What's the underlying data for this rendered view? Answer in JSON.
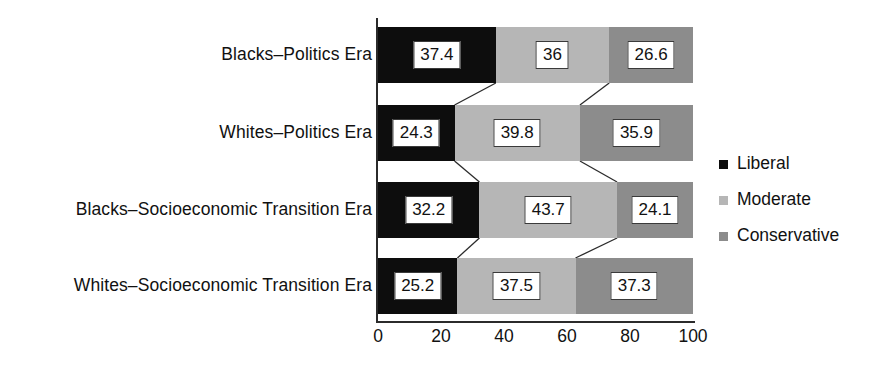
{
  "chart_data": {
    "type": "bar",
    "orientation": "horizontal",
    "stacked": true,
    "title": "",
    "subtitle": "",
    "xlabel": "",
    "ylabel": "",
    "xlim": [
      0,
      100
    ],
    "xticks": [
      "0",
      "20",
      "40",
      "60",
      "80",
      "100"
    ],
    "xtick_values": [
      0,
      20,
      40,
      60,
      80,
      100
    ],
    "grid": false,
    "legend_position": "right",
    "categories": [
      "Blacks–Politics Era",
      "Whites–Politics Era",
      "Blacks–Socioeconomic Transition Era",
      "Whites–Socioeconomic Transition Era"
    ],
    "series": [
      {
        "name": "Liberal",
        "color": "#0d0d0d",
        "values": [
          37.4,
          24.3,
          32.2,
          25.2
        ],
        "labels": [
          "37.4",
          "24.3",
          "32.2",
          "25.2"
        ]
      },
      {
        "name": "Moderate",
        "color": "#b6b6b6",
        "values": [
          36,
          39.8,
          43.7,
          37.5
        ],
        "labels": [
          "36",
          "39.8",
          "43.7",
          "37.5"
        ]
      },
      {
        "name": "Conservative",
        "color": "#8c8c8c",
        "values": [
          26.6,
          35.9,
          24.1,
          37.3
        ],
        "labels": [
          "26.6",
          "35.9",
          "24.1",
          "37.3"
        ]
      }
    ]
  },
  "legend": {
    "items": [
      {
        "label": "Liberal",
        "color": "#0d0d0d"
      },
      {
        "label": "Moderate",
        "color": "#b6b6b6"
      },
      {
        "label": "Conservative",
        "color": "#8c8c8c"
      }
    ]
  }
}
